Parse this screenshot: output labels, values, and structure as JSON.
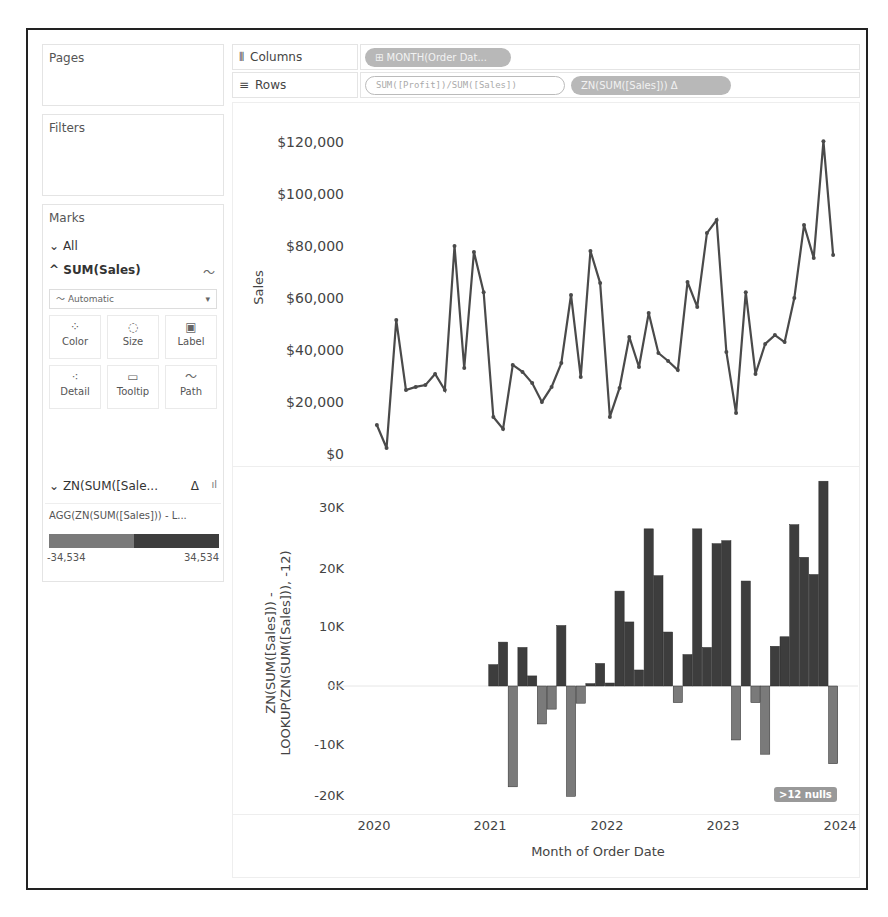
{
  "left_panel": {
    "pages_title": "Pages",
    "filters_title": "Filters",
    "marks_title": "Marks",
    "all_label": "All",
    "sum_sales_label": "SUM(Sales)",
    "mark_type": "Automatic",
    "mark_buttons": [
      {
        "label": "Color",
        "icon": "color-dots-icon"
      },
      {
        "label": "Size",
        "icon": "size-circles-icon"
      },
      {
        "label": "Label",
        "icon": "label-box-icon"
      },
      {
        "label": "Detail",
        "icon": "detail-dots-icon"
      },
      {
        "label": "Tooltip",
        "icon": "tooltip-bubble-icon"
      },
      {
        "label": "Path",
        "icon": "path-line-icon"
      }
    ],
    "zn_label": "ZN(SUM([Sale...",
    "zn_delta": "Δ",
    "legend_title": "AGG(ZN(SUM([Sales])) - L...",
    "legend_min": "-34,534",
    "legend_max": "34,534"
  },
  "shelves": {
    "columns_label": "Columns",
    "rows_label": "Rows",
    "columns_pill": "⊞ MONTH(Order Dat...",
    "rows_pill_1": "SUM([Profit])/SUM([Sales])",
    "rows_pill_2": "ZN(SUM([Sales]))   Δ"
  },
  "colors": {
    "line": "#4a4a4a",
    "bar_positive": "#3d3d3d",
    "bar_negative": "#7a7a7a",
    "legend_neg": "#7a7a7a",
    "legend_pos": "#3d3d3d"
  },
  "nulls_badge": ">12 nulls",
  "chart_data": [
    {
      "type": "line",
      "title": "",
      "xlabel": "Month of Order Date",
      "ylabel": "Sales",
      "ylim": [
        0,
        120000
      ],
      "yticks": [
        "$0",
        "$20,000",
        "$40,000",
        "$60,000",
        "$80,000",
        "$100,000",
        "$120,000"
      ],
      "x": [
        "2020-01",
        "2020-02",
        "2020-03",
        "2020-04",
        "2020-05",
        "2020-06",
        "2020-07",
        "2020-08",
        "2020-09",
        "2020-10",
        "2020-11",
        "2020-12",
        "2021-01",
        "2021-02",
        "2021-03",
        "2021-04",
        "2021-05",
        "2021-06",
        "2021-07",
        "2021-08",
        "2021-09",
        "2021-10",
        "2021-11",
        "2021-12",
        "2022-01",
        "2022-02",
        "2022-03",
        "2022-04",
        "2022-05",
        "2022-06",
        "2022-07",
        "2022-08",
        "2022-09",
        "2022-10",
        "2022-11",
        "2022-12",
        "2023-01",
        "2023-02",
        "2023-03",
        "2023-04",
        "2023-05",
        "2023-06",
        "2023-07",
        "2023-08",
        "2023-09",
        "2023-10",
        "2023-11",
        "2023-12"
      ],
      "values": [
        11200,
        2300,
        51700,
        24700,
        25900,
        26600,
        30900,
        24700,
        80300,
        33200,
        78000,
        62500,
        14300,
        9700,
        34400,
        31700,
        27400,
        20100,
        25900,
        35100,
        61400,
        29700,
        78400,
        66000,
        14300,
        25500,
        45200,
        33600,
        54400,
        39000,
        35900,
        32400,
        66400,
        56800,
        85300,
        90300,
        39400,
        15800,
        62500,
        30900,
        42500,
        45900,
        43200,
        60200,
        88400,
        75700,
        120800,
        76800
      ]
    },
    {
      "type": "bar",
      "title": "",
      "xlabel": "Month of Order Date",
      "ylabel": "ZN(SUM([Sales])) - LOOKUP(ZN(SUM([Sales])), -12)",
      "ylim": [
        -20000,
        35000
      ],
      "yticks": [
        "-20K",
        "-10K",
        "0K",
        "10K",
        "20K",
        "30K"
      ],
      "xticks": [
        "2020",
        "2021",
        "2022",
        "2023",
        "2024"
      ],
      "x": [
        "2021-01",
        "2021-02",
        "2021-03",
        "2021-04",
        "2021-05",
        "2021-06",
        "2021-07",
        "2021-08",
        "2021-09",
        "2021-10",
        "2021-11",
        "2021-12",
        "2022-01",
        "2022-02",
        "2022-03",
        "2022-04",
        "2022-05",
        "2022-06",
        "2022-07",
        "2022-08",
        "2022-09",
        "2022-10",
        "2022-11",
        "2022-12",
        "2023-01",
        "2023-02",
        "2023-03",
        "2023-04",
        "2023-05",
        "2023-06",
        "2023-07",
        "2023-08",
        "2023-09",
        "2023-10",
        "2023-11",
        "2023-12"
      ],
      "values": [
        3600,
        7400,
        -17000,
        6500,
        1700,
        -6400,
        -3900,
        10200,
        -18600,
        -2900,
        400,
        3800,
        500,
        16000,
        10800,
        2700,
        26500,
        18600,
        9100,
        -2800,
        5300,
        26500,
        6500,
        24000,
        24500,
        -9100,
        17700,
        -2800,
        -11500,
        6700,
        8300,
        27200,
        21700,
        18800,
        34534,
        -13100
      ],
      "nulls": ">12 nulls"
    }
  ]
}
